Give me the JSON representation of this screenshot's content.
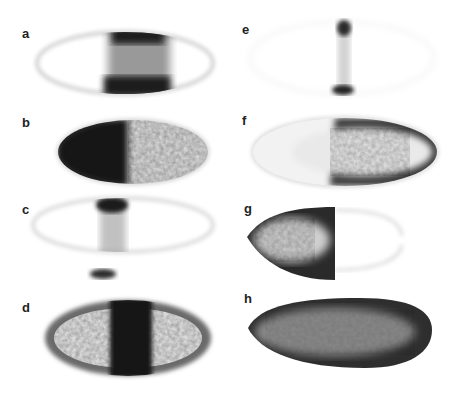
{
  "figure": {
    "panels": [
      {
        "id": "a",
        "label": "a",
        "description": "embryo with central dark vertical stripe, faint outline"
      },
      {
        "id": "b",
        "label": "b",
        "description": "embryo with dark anterior half, lighter posterior"
      },
      {
        "id": "c",
        "label": "c",
        "description": "faint embryo with narrow central stripe darker at top and bottom"
      },
      {
        "id": "d",
        "label": "d",
        "description": "embryo with dark outline and dark central stripe"
      },
      {
        "id": "e",
        "label": "e",
        "description": "very faint embryo with narrow stripe dark only at top and bottom edges"
      },
      {
        "id": "f",
        "label": "f",
        "description": "embryo with dark posterior rim"
      },
      {
        "id": "g",
        "label": "g",
        "description": "embryo with dark anterior cap, faint posterior"
      },
      {
        "id": "h",
        "label": "h",
        "description": "uniformly dark embryo"
      }
    ]
  }
}
